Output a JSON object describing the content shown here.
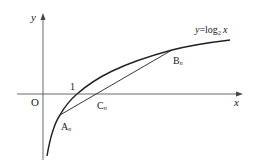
{
  "diagram": {
    "type": "function-graph",
    "function_label": {
      "y": "y",
      "eq": "=log",
      "base": "2",
      "x": "x"
    },
    "axes": {
      "x_label": "x",
      "y_label": "y",
      "origin_label": "O",
      "tick_one_label": "1"
    },
    "points": {
      "A": {
        "letter": "A",
        "sub": "n"
      },
      "B": {
        "letter": "B",
        "sub": "n"
      },
      "C": {
        "letter": "C",
        "sub": "n"
      }
    },
    "colors": {
      "stroke": "#222222",
      "axis": "#444444",
      "background": "#ffffff"
    }
  }
}
